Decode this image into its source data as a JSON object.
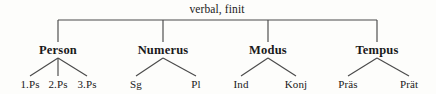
{
  "diagram": {
    "type": "tree",
    "root": {
      "label": "verbal, finit",
      "x": 217,
      "y": 4
    },
    "line_color": "#4a4a4a",
    "text_color": "#1a1a1a",
    "background": "#fdfdfb",
    "bus": {
      "y": 20,
      "x_start": 58,
      "x_end": 377,
      "drop_to_y": 42
    },
    "categories": [
      {
        "label": "Person",
        "x": 58,
        "y": 44,
        "branch_top_y": 58,
        "branch_bottom_y": 76,
        "children": [
          {
            "label": "1.Ps",
            "x": 30,
            "y": 79
          },
          {
            "label": "2.Ps",
            "x": 58,
            "y": 79
          },
          {
            "label": "3.Ps",
            "x": 87,
            "y": 79
          }
        ]
      },
      {
        "label": "Numerus",
        "x": 163,
        "y": 44,
        "branch_top_y": 58,
        "branch_bottom_y": 76,
        "children": [
          {
            "label": "Sg",
            "x": 136,
            "y": 79
          },
          {
            "label": "Pl",
            "x": 196,
            "y": 79
          }
        ]
      },
      {
        "label": "Modus",
        "x": 268,
        "y": 44,
        "branch_top_y": 58,
        "branch_bottom_y": 76,
        "children": [
          {
            "label": "Ind",
            "x": 241,
            "y": 79
          },
          {
            "label": "Konj",
            "x": 296,
            "y": 79
          }
        ]
      },
      {
        "label": "Tempus",
        "x": 377,
        "y": 44,
        "branch_top_y": 58,
        "branch_bottom_y": 76,
        "children": [
          {
            "label": "Präs",
            "x": 348,
            "y": 79
          },
          {
            "label": "Prät",
            "x": 409,
            "y": 79
          }
        ]
      }
    ]
  }
}
